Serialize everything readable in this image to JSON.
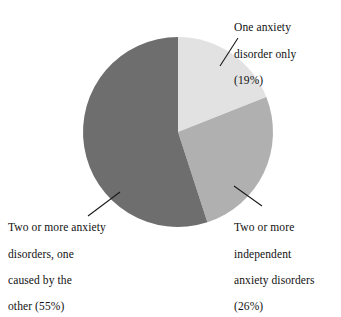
{
  "figure": {
    "background_color": "#ffffff",
    "text_color": "#111111"
  },
  "chart_data": {
    "type": "pie",
    "title": "",
    "subtitle": "",
    "xlabel": "",
    "ylabel": "",
    "grid": false,
    "legend_position": "callout-labels",
    "units": "percent",
    "total": 100,
    "start_angle_deg": 0,
    "direction": "clockwise",
    "center": {
      "x": 178,
      "y": 132
    },
    "radius": 95,
    "categories": [
      "One anxiety disorder only",
      "Two or more independent anxiety disorders",
      "Two or more anxiety disorders, one caused by the other"
    ],
    "values": [
      19,
      26,
      55
    ],
    "colors": [
      "#e2e2e2",
      "#b0b0b0",
      "#6e6e6e"
    ],
    "slices": [
      {
        "name": "one-anxiety-disorder-only",
        "label": "One anxiety disorder only",
        "value": 19,
        "percent_text": "(19%)",
        "color": "#e2e2e2",
        "start_angle_deg": 0,
        "end_angle_deg": 68.4
      },
      {
        "name": "two-or-more-independent",
        "label": "Two or more independent anxiety disorders",
        "value": 26,
        "percent_text": "(26%)",
        "color": "#b0b0b0",
        "start_angle_deg": 68.4,
        "end_angle_deg": 162.0
      },
      {
        "name": "two-or-more-one-caused-by-other",
        "label": "Two or more anxiety disorders, one caused by the other",
        "value": 55,
        "percent_text": "(55%)",
        "color": "#6e6e6e",
        "start_angle_deg": 162.0,
        "end_angle_deg": 360.0
      }
    ]
  },
  "callouts": {
    "one_anxiety": {
      "line1": "One anxiety",
      "line2": "disorder only",
      "line3": "(19%)"
    },
    "independent": {
      "line1": "Two or more",
      "line2": "independent",
      "line3": "anxiety disorders",
      "line4": "(26%)"
    },
    "caused_by": {
      "line1": "Two or more anxiety",
      "line2": "disorders, one",
      "line3": "caused by the",
      "line4": "other (55%)"
    }
  }
}
